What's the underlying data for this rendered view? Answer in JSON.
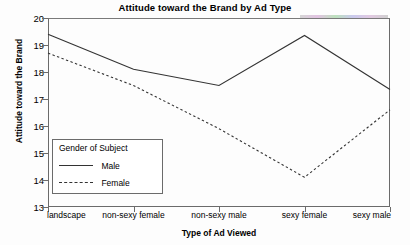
{
  "chart_data": {
    "type": "line",
    "title": "Attitude toward the Brand by Ad Type",
    "xlabel": "Type of Ad Viewed",
    "ylabel": "Attitude toward the Brand",
    "categories": [
      "landscape",
      "non-sexy female",
      "non-sexy male",
      "sexy female",
      "sexy male"
    ],
    "ylim": [
      13,
      20
    ],
    "yticks": [
      13,
      14,
      15,
      16,
      17,
      18,
      19,
      20
    ],
    "grid": false,
    "legend_position": "inside-lower-left",
    "legend_title": "Gender of Subject",
    "series": [
      {
        "name": "Male",
        "style": "solid",
        "values": [
          19.4,
          18.1,
          17.5,
          19.35,
          17.35
        ]
      },
      {
        "name": "Female",
        "style": "dashed",
        "values": [
          18.7,
          17.5,
          15.9,
          14.1,
          16.6
        ]
      }
    ]
  }
}
